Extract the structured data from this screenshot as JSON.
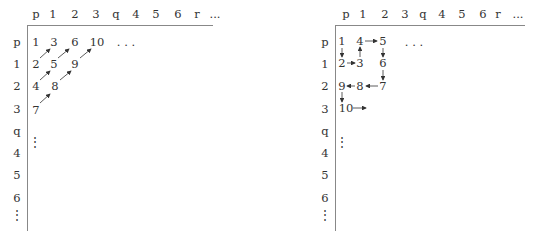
{
  "left": {
    "col_headers": [
      "p",
      "1",
      "2",
      "3",
      "q",
      "4",
      "5",
      "6",
      "r",
      "..."
    ],
    "row_headers": [
      "p",
      "1",
      "2",
      "3",
      "q",
      "4",
      "5",
      "6"
    ],
    "cells": [
      {
        "v": "1",
        "c": 0,
        "r": 0
      },
      {
        "v": "3",
        "c": 1,
        "r": 0
      },
      {
        "v": "6",
        "c": 2,
        "r": 0
      },
      {
        "v": "10",
        "c": 3,
        "r": 0
      },
      {
        "v": ". . .",
        "c": 5,
        "r": 0
      },
      {
        "v": "2",
        "c": 0,
        "r": 1
      },
      {
        "v": "5",
        "c": 1,
        "r": 1
      },
      {
        "v": "9",
        "c": 2,
        "r": 1
      },
      {
        "v": "4",
        "c": 0,
        "r": 2
      },
      {
        "v": "8",
        "c": 1,
        "r": 2
      },
      {
        "v": "7",
        "c": 0,
        "r": 3
      }
    ],
    "traversal": "diagonal",
    "arrows": [
      [
        "2",
        "3"
      ],
      [
        "4",
        "5"
      ],
      [
        "5",
        "6"
      ],
      [
        "7",
        "8"
      ],
      [
        "8",
        "9"
      ],
      [
        "9",
        "10"
      ]
    ]
  },
  "right": {
    "col_headers": [
      "p",
      "1",
      "2",
      "3",
      "q",
      "4",
      "5",
      "6",
      "r",
      "..."
    ],
    "row_headers": [
      "p",
      "1",
      "2",
      "3",
      "q",
      "4",
      "5",
      "6"
    ],
    "cells": [
      {
        "v": "1",
        "c": 0,
        "r": 0
      },
      {
        "v": "4",
        "c": 1,
        "r": 0
      },
      {
        "v": "5",
        "c": 2,
        "r": 0
      },
      {
        "v": ". . .",
        "c": 4,
        "r": 0
      },
      {
        "v": "2",
        "c": 0,
        "r": 1
      },
      {
        "v": "3",
        "c": 1,
        "r": 1
      },
      {
        "v": "6",
        "c": 2,
        "r": 1
      },
      {
        "v": "9",
        "c": 0,
        "r": 2
      },
      {
        "v": "8",
        "c": 1,
        "r": 2
      },
      {
        "v": "7",
        "c": 2,
        "r": 2
      },
      {
        "v": "10",
        "c": 0,
        "r": 3
      }
    ],
    "traversal": "square-shell",
    "arrows": [
      [
        "1",
        "2"
      ],
      [
        "2",
        "3"
      ],
      [
        "3",
        "4"
      ],
      [
        "4",
        "5"
      ],
      [
        "5",
        "6"
      ],
      [
        "6",
        "7"
      ],
      [
        "7",
        "8"
      ],
      [
        "8",
        "9"
      ],
      [
        "9",
        "10"
      ],
      [
        "10",
        "→"
      ]
    ]
  },
  "vertical_dots": "⋮"
}
